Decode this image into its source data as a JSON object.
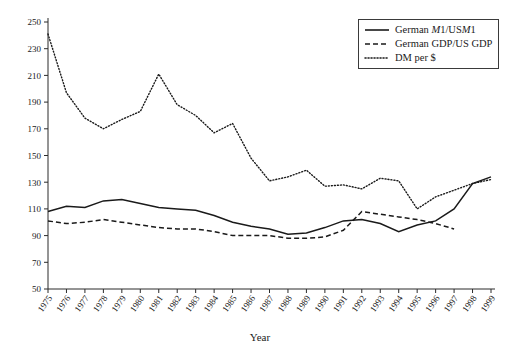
{
  "chart_data": {
    "type": "line",
    "title": "",
    "xlabel": "Year",
    "ylabel": "",
    "xlim": [
      1975,
      1999
    ],
    "ylim": [
      50,
      250
    ],
    "ytick_step": 20,
    "grid": false,
    "legend_position": "top-right",
    "x": [
      1975,
      1976,
      1977,
      1978,
      1979,
      1980,
      1981,
      1982,
      1983,
      1984,
      1985,
      1986,
      1987,
      1988,
      1989,
      1990,
      1991,
      1992,
      1993,
      1994,
      1995,
      1996,
      1997,
      1998,
      1999
    ],
    "xtick_labels": [
      "1975",
      "1976",
      "1977",
      "1978",
      "1979",
      "1980",
      "1981",
      "1982",
      "1983",
      "1984",
      "1985",
      "1986",
      "1987",
      "1988",
      "1989",
      "1990",
      "1991",
      "1992",
      "1993",
      "1994",
      "1995",
      "1996",
      "1997",
      "1998",
      "1999"
    ],
    "ytick_labels": [
      "50",
      "70",
      "90",
      "110",
      "130",
      "150",
      "170",
      "190",
      "210",
      "230",
      "250"
    ],
    "ytick_values": [
      50,
      70,
      90,
      110,
      130,
      150,
      170,
      190,
      210,
      230,
      250
    ],
    "series": [
      {
        "name": "German M1/USM1",
        "style": "solid",
        "color": "#1a1a1a",
        "x": [
          1975,
          1976,
          1977,
          1978,
          1979,
          1980,
          1981,
          1982,
          1983,
          1984,
          1985,
          1986,
          1987,
          1988,
          1989,
          1990,
          1991,
          1992,
          1993,
          1994,
          1995,
          1996,
          1997,
          1998,
          1999
        ],
        "values": [
          108,
          112,
          111,
          116,
          117,
          114,
          111,
          110,
          109,
          105,
          100,
          97,
          95,
          91,
          92,
          96,
          101,
          102,
          99,
          93,
          98,
          101,
          110,
          129,
          134
        ]
      },
      {
        "name": "German GDP/US GDP",
        "style": "dashed",
        "color": "#1a1a1a",
        "x": [
          1975,
          1976,
          1977,
          1978,
          1979,
          1980,
          1981,
          1982,
          1983,
          1984,
          1985,
          1986,
          1987,
          1988,
          1989,
          1990,
          1991,
          1992,
          1993,
          1994,
          1995,
          1996,
          1997
        ],
        "values": [
          101,
          99,
          100,
          102,
          100,
          98,
          96,
          95,
          95,
          93,
          90,
          90,
          90,
          88,
          88,
          89,
          94,
          108,
          106,
          104,
          102,
          99,
          95
        ]
      },
      {
        "name": "DM per $",
        "style": "dotted",
        "color": "#1a1a1a",
        "x": [
          1975,
          1976,
          1977,
          1978,
          1979,
          1980,
          1981,
          1982,
          1983,
          1984,
          1985,
          1986,
          1987,
          1988,
          1989,
          1990,
          1991,
          1992,
          1993,
          1994,
          1995,
          1996,
          1997,
          1998,
          1999
        ],
        "values": [
          241,
          197,
          178,
          170,
          177,
          183,
          211,
          188,
          180,
          167,
          174,
          148,
          131,
          134,
          139,
          127,
          128,
          125,
          133,
          131,
          110,
          119,
          124,
          129,
          132
        ]
      }
    ]
  },
  "legend": {
    "items": [
      {
        "style": "solid",
        "label_pre": "German ",
        "label_italic": "M",
        "label_post": "1/US",
        "label_italic2": "M",
        "label_tail": "1"
      },
      {
        "style": "dashed",
        "label": "German GDP/US GDP"
      },
      {
        "style": "dotted",
        "label": "DM per $"
      }
    ]
  },
  "axis": {
    "x_title": "Year"
  }
}
